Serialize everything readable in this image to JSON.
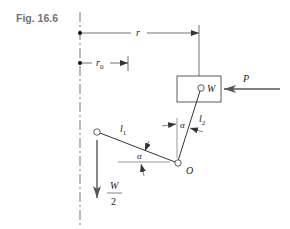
{
  "figure": {
    "label": "Fig. 16.6"
  },
  "diagram": {
    "labels": {
      "r": "r",
      "r0_base": "r",
      "r0_sub": "0",
      "W": "W",
      "P": "P",
      "l1_base": "l",
      "l1_sub": "1",
      "l2_base": "l",
      "l2_sub": "2",
      "alpha_upper": "α",
      "alpha_lower": "α",
      "O": "O",
      "half_num": "W",
      "half_den": "2"
    },
    "colors": {
      "line": "#3a3a3a",
      "arrow": "#4a4a4a",
      "axis": "#555555",
      "label_gray": "#6f7478"
    }
  }
}
